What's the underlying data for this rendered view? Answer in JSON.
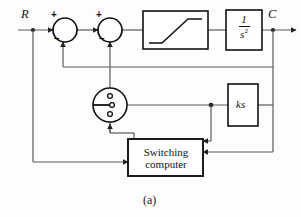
{
  "figure": {
    "caption": "(a)",
    "type": "control-system-block-diagram"
  },
  "signals": {
    "input_label": "R",
    "output_label": "C"
  },
  "summing_junctions": [
    {
      "name": "first-summing-junction",
      "plus_sign": "+",
      "minus_sign": "−"
    },
    {
      "name": "second-summing-junction",
      "plus_sign": "+",
      "minus_sign": "−"
    }
  ],
  "blocks": {
    "saturation": {
      "label": "",
      "description": "saturation-nonlinearity"
    },
    "plant": {
      "numerator": "1",
      "denominator": "s",
      "denominator_exponent": "2"
    },
    "rate_gain": {
      "label": "ks"
    },
    "switching_computer": {
      "line1": "Switching",
      "line2": "computer"
    },
    "switch": {
      "description": "rotary-switch"
    }
  },
  "colors": {
    "line": "#4a4a4a",
    "block_border": "#111111",
    "text": "#111111",
    "background": "#fdfdfd"
  }
}
